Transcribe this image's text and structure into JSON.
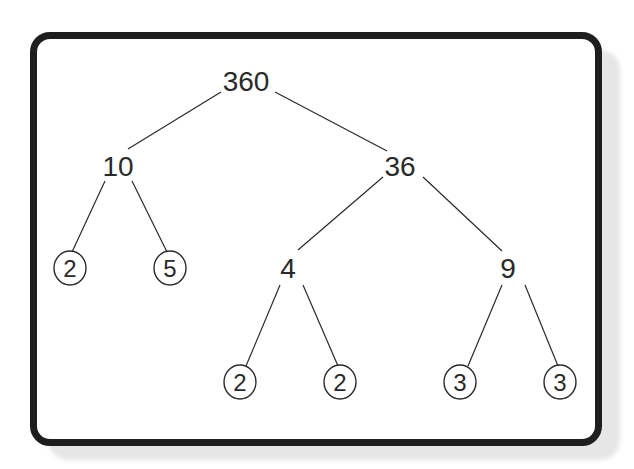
{
  "diagram": {
    "type": "factor-tree",
    "root": "360",
    "nodes": [
      {
        "id": "n360",
        "label": "360",
        "x": 246,
        "y": 80,
        "circled": false
      },
      {
        "id": "n10",
        "label": "10",
        "x": 118,
        "y": 165,
        "circled": false
      },
      {
        "id": "n36",
        "label": "36",
        "x": 400,
        "y": 165,
        "circled": false
      },
      {
        "id": "n2a",
        "label": "2",
        "x": 70,
        "y": 268,
        "circled": true
      },
      {
        "id": "n5",
        "label": "5",
        "x": 170,
        "y": 268,
        "circled": true
      },
      {
        "id": "n4",
        "label": "4",
        "x": 288,
        "y": 268,
        "circled": false
      },
      {
        "id": "n9",
        "label": "9",
        "x": 508,
        "y": 268,
        "circled": false
      },
      {
        "id": "n2b",
        "label": "2",
        "x": 240,
        "y": 382,
        "circled": true
      },
      {
        "id": "n2c",
        "label": "2",
        "x": 340,
        "y": 382,
        "circled": true
      },
      {
        "id": "n3a",
        "label": "3",
        "x": 460,
        "y": 382,
        "circled": true
      },
      {
        "id": "n3b",
        "label": "3",
        "x": 560,
        "y": 382,
        "circled": true
      }
    ],
    "edges": [
      {
        "from": "n360",
        "to": "n10"
      },
      {
        "from": "n360",
        "to": "n36"
      },
      {
        "from": "n10",
        "to": "n2a"
      },
      {
        "from": "n10",
        "to": "n5"
      },
      {
        "from": "n36",
        "to": "n4"
      },
      {
        "from": "n36",
        "to": "n9"
      },
      {
        "from": "n4",
        "to": "n2b"
      },
      {
        "from": "n4",
        "to": "n2c"
      },
      {
        "from": "n9",
        "to": "n3a"
      },
      {
        "from": "n9",
        "to": "n3b"
      }
    ],
    "prime_factors": [
      "2",
      "5",
      "2",
      "2",
      "3",
      "3"
    ],
    "colors": {
      "stroke": "#2a2a2a",
      "frame": "#1e1e1e",
      "shadow": "#e6e6e6"
    }
  }
}
